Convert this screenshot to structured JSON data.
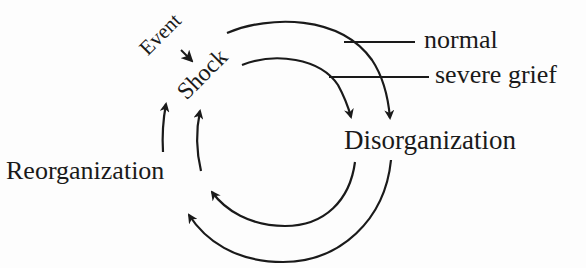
{
  "diagram": {
    "type": "cycle",
    "nodes": {
      "event": "Event",
      "shock": "Shock",
      "disorganization": "Disorganization",
      "reorganization": "Reorganization"
    },
    "legend": {
      "normal": "normal",
      "severe_grief": "severe grief"
    },
    "edges": [
      {
        "from": "Event",
        "to": "Shock"
      },
      {
        "from": "Shock",
        "to": "Disorganization",
        "path": "normal"
      },
      {
        "from": "Shock",
        "to": "Disorganization",
        "path": "severe grief"
      },
      {
        "from": "Disorganization",
        "to": "Reorganization",
        "path": "normal"
      },
      {
        "from": "Disorganization",
        "to": "Reorganization",
        "path": "severe grief"
      },
      {
        "from": "Reorganization",
        "to": "Shock",
        "path": "normal"
      },
      {
        "from": "Reorganization",
        "to": "Shock",
        "path": "severe grief"
      }
    ],
    "colors": {
      "ink": "#1a1a1a",
      "background": "#fdfdfd"
    }
  }
}
